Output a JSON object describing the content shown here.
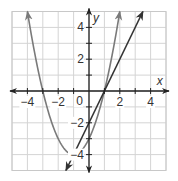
{
  "chart_data": {
    "type": "line",
    "title": "",
    "xlabel": "x",
    "ylabel": "y",
    "xlim": [
      -5,
      5
    ],
    "ylim": [
      -5,
      5
    ],
    "grid": true,
    "x_ticks": [
      -4,
      -2,
      0,
      2,
      4
    ],
    "y_ticks": [
      4,
      2,
      -2,
      -4
    ],
    "x_tick_labels": [
      "−4",
      "−2",
      "0",
      "2",
      "4"
    ],
    "y_tick_labels": [
      "4",
      "2",
      "−2",
      "−4"
    ],
    "origin_label": "0",
    "series": [
      {
        "name": "parabola",
        "equation": "y = x^2 + 2x - 3",
        "color": "#7a7a7a",
        "x": [
          -4,
          -3,
          -2,
          -1,
          0,
          1,
          2
        ],
        "y": [
          5,
          0,
          -3,
          -4,
          -3,
          0,
          5
        ]
      },
      {
        "name": "line",
        "equation": "y = 2x - 2",
        "color": "#333333",
        "x": [
          -1.5,
          0,
          1,
          3.5
        ],
        "y": [
          -5,
          -2,
          0,
          5
        ]
      }
    ],
    "legend": "none"
  }
}
